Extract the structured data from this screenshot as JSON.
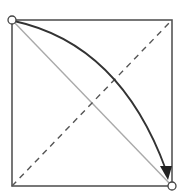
{
  "diagram": {
    "type": "geometric-square-diagonals",
    "width": 186,
    "height": 194,
    "square": {
      "x": 12,
      "y": 20,
      "size": 160,
      "color": "#555555"
    },
    "solid_diagonal": {
      "from": "top-left",
      "to": "bottom-right",
      "color": "#aaaaaa"
    },
    "dashed_diagonal": {
      "from": "bottom-left",
      "to": "top-right",
      "color": "#555555"
    },
    "arc_arrow": {
      "from": "top-left",
      "to": "bottom-right",
      "color": "#333333"
    },
    "markers": [
      {
        "name": "start-point",
        "position": "top-left"
      },
      {
        "name": "end-point",
        "position": "bottom-right"
      }
    ]
  }
}
